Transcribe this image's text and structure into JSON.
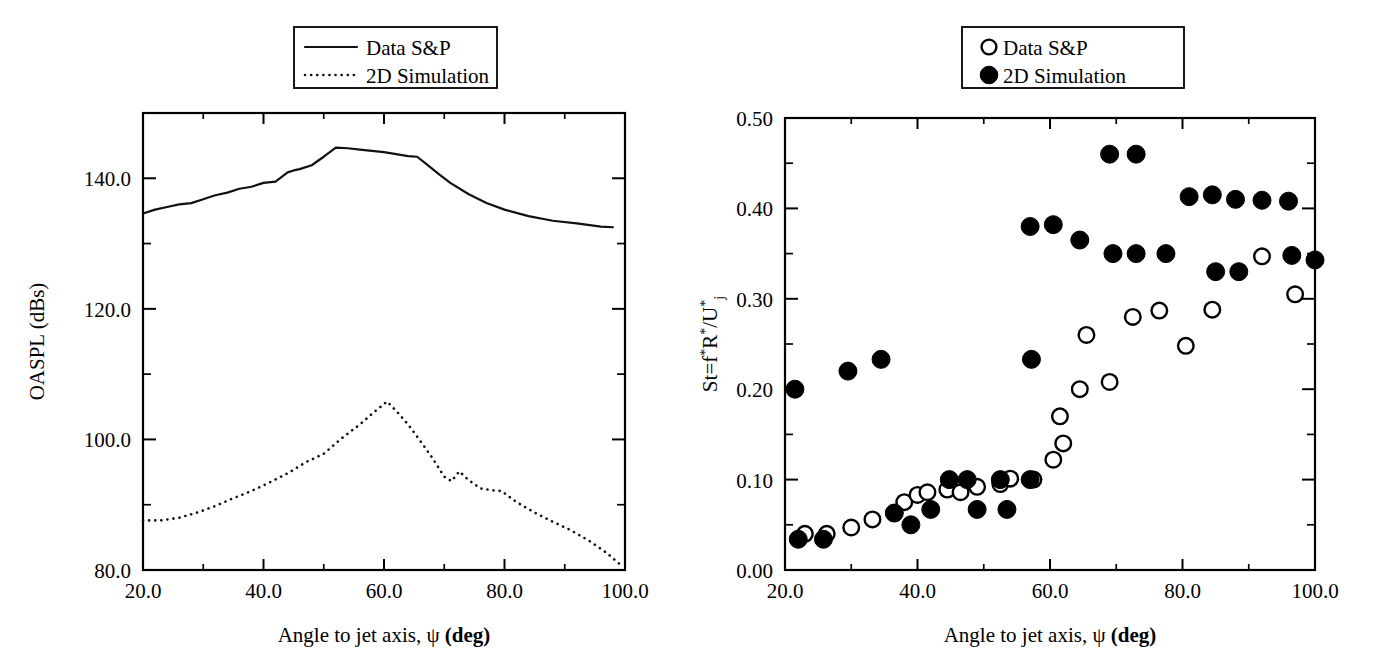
{
  "figure": {
    "background": "#ffffff",
    "ink_color": "#000000"
  },
  "panels": [
    {
      "id": "left",
      "name": "oaspl-directivity-plot",
      "legend": {
        "position": "top-center",
        "entries": [
          {
            "label": "Data S&P",
            "style": "solid-line",
            "icon": "solid-line-swatch"
          },
          {
            "label": "2D Simulation",
            "style": "dotted-line",
            "icon": "dotted-line-swatch"
          }
        ]
      }
    },
    {
      "id": "right",
      "name": "strouhal-peak-plot",
      "legend": {
        "position": "top-right",
        "entries": [
          {
            "label": "Data S&P",
            "style": "open-circle",
            "icon": "open-circle-marker"
          },
          {
            "label": "2D Simulation",
            "style": "filled-circle",
            "icon": "filled-circle-marker"
          }
        ]
      }
    }
  ],
  "chart_data": [
    {
      "type": "line",
      "id": "left-panel",
      "title": "",
      "xlabel_parts": {
        "pre": "Angle to jet axis, ",
        "symbol": "ψ",
        "post": " (deg)"
      },
      "xlabel": "Angle to jet axis, ψ (deg)",
      "ylabel": "OASPL (dBs)",
      "xlim": [
        20.0,
        100.0
      ],
      "ylim": [
        80.0,
        150.0
      ],
      "xticks": [
        20.0,
        40.0,
        60.0,
        80.0,
        100.0
      ],
      "xtick_labels": [
        "20.0",
        "40.0",
        "60.0",
        "80.0",
        "100.0"
      ],
      "xticks_minor": [
        30.0,
        50.0,
        70.0,
        90.0
      ],
      "yticks": [
        80.0,
        100.0,
        120.0,
        140.0
      ],
      "ytick_labels": [
        "80.0",
        "100.0",
        "120.0",
        "140.0"
      ],
      "yticks_minor": [
        90.0,
        110.0,
        130.0
      ],
      "grid": false,
      "legend_position": "top-center",
      "series": [
        {
          "name": "Data S&P",
          "style": "solid",
          "x": [
            20.0,
            22.0,
            24.0,
            26.0,
            28.0,
            30.0,
            32.0,
            34.0,
            36.0,
            38.0,
            40.0,
            42.0,
            44.0,
            45.0,
            46.0,
            48.0,
            50.0,
            52.0,
            54.0,
            56.0,
            58.0,
            60.0,
            62.0,
            64.0,
            65.5,
            67.0,
            69.0,
            71.0,
            74.0,
            77.0,
            80.0,
            84.0,
            88.0,
            92.0,
            96.0,
            98.0
          ],
          "y": [
            134.6,
            135.2,
            135.6,
            136.0,
            136.2,
            136.8,
            137.4,
            137.8,
            138.4,
            138.7,
            139.3,
            139.5,
            140.9,
            141.2,
            141.4,
            142.0,
            143.3,
            144.7,
            144.6,
            144.4,
            144.2,
            144.0,
            143.7,
            143.4,
            143.3,
            142.2,
            140.7,
            139.3,
            137.6,
            136.2,
            135.2,
            134.2,
            133.5,
            133.1,
            132.6,
            132.5
          ]
        },
        {
          "name": "2D Simulation",
          "style": "dotted",
          "x": [
            20.0,
            23.0,
            26.0,
            29.0,
            32.0,
            35.0,
            38.0,
            41.0,
            44.0,
            47.0,
            50.0,
            53.0,
            56.0,
            58.5,
            60.5,
            62.0,
            64.0,
            66.0,
            68.0,
            70.0,
            71.2,
            72.5,
            74.0,
            76.0,
            78.0,
            79.5,
            82.0,
            85.0,
            88.0,
            91.0,
            94.0,
            97.0,
            99.0
          ],
          "y": [
            87.6,
            87.6,
            88.0,
            88.8,
            89.8,
            91.0,
            92.1,
            93.4,
            94.8,
            96.5,
            97.8,
            100.2,
            102.3,
            104.3,
            105.8,
            104.4,
            102.3,
            99.8,
            97.2,
            94.3,
            93.6,
            95.1,
            93.8,
            92.5,
            92.2,
            92.1,
            90.4,
            88.8,
            87.4,
            86.1,
            84.5,
            82.6,
            81.0
          ]
        }
      ]
    },
    {
      "type": "scatter",
      "id": "right-panel",
      "title": "",
      "xlabel_parts": {
        "pre": "Angle to jet axis, ",
        "symbol": "ψ",
        "post": " (deg)"
      },
      "xlabel": "Angle to jet axis, ψ (deg)",
      "ylabel": "St=f*R*/U*j",
      "ylabel_parts": {
        "a": "St=f",
        "star1": "*",
        "b": "R",
        "star2": "*",
        "c": "/U",
        "star3": "*",
        "sub": "j"
      },
      "xlim": [
        20.0,
        100.0
      ],
      "ylim": [
        0.0,
        0.5
      ],
      "xticks": [
        20.0,
        40.0,
        60.0,
        80.0,
        100.0
      ],
      "xtick_labels": [
        "20.0",
        "40.0",
        "60.0",
        "80.0",
        "100.0"
      ],
      "xticks_minor": [
        30.0,
        50.0,
        70.0,
        90.0
      ],
      "yticks": [
        0.0,
        0.1,
        0.2,
        0.3,
        0.4,
        0.5
      ],
      "ytick_labels": [
        "0.00",
        "0.10",
        "0.20",
        "0.30",
        "0.40",
        "0.50"
      ],
      "yticks_minor": [
        0.05,
        0.15,
        0.25,
        0.35,
        0.45
      ],
      "grid": false,
      "legend_position": "top-right",
      "series": [
        {
          "name": "Data S&P",
          "marker": "open-circle",
          "points": [
            [
              23.0,
              0.04
            ],
            [
              26.3,
              0.04
            ],
            [
              30.0,
              0.047
            ],
            [
              33.2,
              0.056
            ],
            [
              36.5,
              0.063
            ],
            [
              38.0,
              0.075
            ],
            [
              40.0,
              0.083
            ],
            [
              41.5,
              0.086
            ],
            [
              44.5,
              0.089
            ],
            [
              46.5,
              0.086
            ],
            [
              49.0,
              0.092
            ],
            [
              52.5,
              0.095
            ],
            [
              54.0,
              0.101
            ],
            [
              57.5,
              0.1
            ],
            [
              60.5,
              0.122
            ],
            [
              62.0,
              0.14
            ],
            [
              61.5,
              0.17
            ],
            [
              64.5,
              0.2
            ],
            [
              65.5,
              0.26
            ],
            [
              69.0,
              0.208
            ],
            [
              72.5,
              0.28
            ],
            [
              76.5,
              0.287
            ],
            [
              80.5,
              0.248
            ],
            [
              84.5,
              0.288
            ],
            [
              92.0,
              0.347
            ],
            [
              97.0,
              0.305
            ]
          ]
        },
        {
          "name": "2D Simulation",
          "marker": "filled-circle",
          "points": [
            [
              21.5,
              0.2
            ],
            [
              22.0,
              0.034
            ],
            [
              25.8,
              0.034
            ],
            [
              29.5,
              0.22
            ],
            [
              34.5,
              0.233
            ],
            [
              36.5,
              0.063
            ],
            [
              39.0,
              0.05
            ],
            [
              42.0,
              0.067
            ],
            [
              44.8,
              0.1
            ],
            [
              47.5,
              0.1
            ],
            [
              49.0,
              0.067
            ],
            [
              52.5,
              0.1
            ],
            [
              53.5,
              0.067
            ],
            [
              57.0,
              0.1
            ],
            [
              57.0,
              0.38
            ],
            [
              57.2,
              0.233
            ],
            [
              60.5,
              0.382
            ],
            [
              64.5,
              0.365
            ],
            [
              69.0,
              0.46
            ],
            [
              69.5,
              0.35
            ],
            [
              73.0,
              0.46
            ],
            [
              73.0,
              0.35
            ],
            [
              77.5,
              0.35
            ],
            [
              81.0,
              0.413
            ],
            [
              84.5,
              0.415
            ],
            [
              88.0,
              0.41
            ],
            [
              92.0,
              0.409
            ],
            [
              96.0,
              0.408
            ],
            [
              85.0,
              0.33
            ],
            [
              88.5,
              0.33
            ],
            [
              96.5,
              0.348
            ],
            [
              100.0,
              0.343
            ]
          ]
        }
      ]
    }
  ]
}
